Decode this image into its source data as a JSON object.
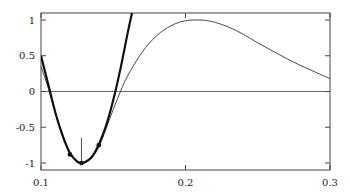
{
  "chart_data": {
    "type": "line",
    "title": "",
    "xlabel": "",
    "ylabel": "",
    "xlim": [
      0.1,
      0.3
    ],
    "ylim": [
      -1.08,
      1.1
    ],
    "grid": false,
    "legend": null,
    "x_ticks": [
      0.1,
      0.2,
      0.3
    ],
    "x_tick_labels": [
      "0.1",
      "0.2",
      "0.3"
    ],
    "y_ticks": [
      1,
      0.5,
      0,
      -0.5,
      -1
    ],
    "y_tick_labels": [
      "1",
      "0.5",
      "0",
      "-0.5",
      "-1"
    ],
    "zero_line": true,
    "series": [
      {
        "name": "function (thin)",
        "style": "thin",
        "x": [
          0.1,
          0.105,
          0.11,
          0.115,
          0.12,
          0.125,
          0.13,
          0.135,
          0.14,
          0.145,
          0.15,
          0.155,
          0.16,
          0.17,
          0.18,
          0.19,
          0.2,
          0.21,
          0.215,
          0.22,
          0.23,
          0.24,
          0.25,
          0.26,
          0.27,
          0.28,
          0.29,
          0.3
        ],
        "values": [
          0.35,
          0.05,
          -0.3,
          -0.6,
          -0.85,
          -0.97,
          -1.0,
          -0.93,
          -0.78,
          -0.52,
          -0.25,
          0.0,
          0.22,
          0.55,
          0.78,
          0.92,
          0.99,
          1.0,
          0.99,
          0.97,
          0.9,
          0.8,
          0.68,
          0.57,
          0.46,
          0.36,
          0.27,
          0.18
        ]
      },
      {
        "name": "quadratic model (thick)",
        "style": "thick",
        "x": [
          0.1,
          0.105,
          0.11,
          0.115,
          0.12,
          0.125,
          0.128,
          0.13,
          0.135,
          0.14,
          0.145,
          0.15,
          0.155,
          0.16,
          0.163
        ],
        "values": [
          0.5,
          0.1,
          -0.3,
          -0.62,
          -0.86,
          -0.98,
          -1.0,
          -0.99,
          -0.92,
          -0.74,
          -0.48,
          -0.12,
          0.32,
          0.82,
          1.1
        ]
      }
    ],
    "markers": [
      {
        "x": 0.12,
        "y": -0.88
      },
      {
        "x": 0.128,
        "y": -1.0
      },
      {
        "x": 0.14,
        "y": -0.75
      }
    ],
    "annotations": [
      {
        "type": "arrow",
        "x": 0.128,
        "y_from": -0.65,
        "y_to": -1.0
      }
    ],
    "colors": {
      "axes": "#444444",
      "thin_line": "#333333",
      "thick_line": "#111111",
      "markers": "#111111"
    }
  }
}
